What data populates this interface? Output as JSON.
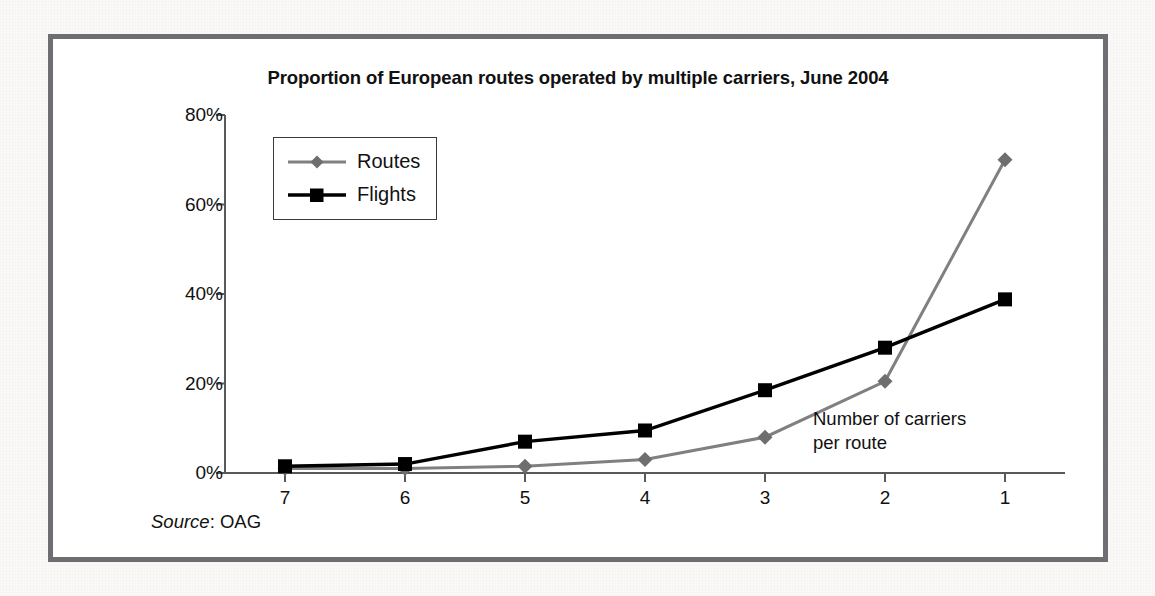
{
  "figure": {
    "title": "Proportion of European routes operated by multiple carriers, June 2004",
    "axis_annotation_line1": "Number of carriers",
    "axis_annotation_line2": "per route",
    "source_label": "Source",
    "source_separator": ": ",
    "source_value": "OAG"
  },
  "colors": {
    "routes": "#808080",
    "flights": "#000000",
    "axis": "#595959",
    "frame": "#6e6e72",
    "text": "#111111",
    "plot_background": "#ffffff",
    "page_background": "#faf9f7"
  },
  "legend": {
    "items": [
      {
        "label": "Routes",
        "marker": "diamond-marker",
        "color": "#808080"
      },
      {
        "label": "Flights",
        "marker": "square-marker",
        "color": "#000000"
      }
    ]
  },
  "chart_data": {
    "type": "line",
    "title": "Proportion of European routes operated by multiple carriers, June 2004",
    "xlabel": "Number of carriers per route",
    "ylabel": "",
    "categories": [
      "7",
      "6",
      "5",
      "4",
      "3",
      "2",
      "1"
    ],
    "x_tick_labels": [
      "7",
      "6",
      "5",
      "4",
      "3",
      "2",
      "1"
    ],
    "y_tick_labels": [
      "0%",
      "20%",
      "40%",
      "60%",
      "80%"
    ],
    "y_tick_values": [
      0,
      20,
      40,
      60,
      80
    ],
    "ylim": [
      0,
      80
    ],
    "y_unit": "%",
    "grid": false,
    "legend_position": "upper-left-inside",
    "series": [
      {
        "name": "Routes",
        "color": "#808080",
        "marker": "diamond",
        "values": [
          1.0,
          1.0,
          1.5,
          3.0,
          8.0,
          20.5,
          70.0
        ]
      },
      {
        "name": "Flights",
        "color": "#000000",
        "marker": "square",
        "values": [
          1.5,
          2.0,
          7.0,
          9.5,
          18.5,
          28.0,
          38.8
        ]
      }
    ],
    "annotations": [
      {
        "text": "Number of carriers per route",
        "position": "inside-lower-right"
      }
    ],
    "source": "Source: OAG"
  }
}
